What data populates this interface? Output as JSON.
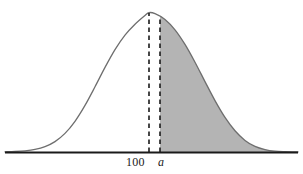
{
  "figure": {
    "title": "",
    "background_color": "#ffffff",
    "curve_color": "#6e6e6e",
    "shade_color": "#b4b4b4",
    "axis_color": "#1a1a1a",
    "dash_color": "#1a1a1a"
  },
  "labels": {
    "mean": "100",
    "cutoff": "a"
  },
  "chart_data": {
    "type": "area",
    "xlabel": "",
    "ylabel": "",
    "grid": false,
    "legend": null,
    "distribution": "normal",
    "mean": 100,
    "mean_pixel_x": 149,
    "cutoff_label": "a",
    "cutoff_pixel_x": 160,
    "baseline_pixel_y": 152,
    "peak_pixel_y": 12,
    "axis_x_start": 5,
    "axis_x_end": 298,
    "shaded_region": "x >= a (right tail)",
    "shaded_fill": "#b4b4b4",
    "markers": [
      {
        "label": "100",
        "pixel_x": 149,
        "style": "dashed-vertical",
        "from_y": 152,
        "to_y": 13
      },
      {
        "label": "a",
        "pixel_x": 160,
        "style": "dashed-vertical",
        "from_y": 152,
        "to_y": 17
      }
    ],
    "curve_points": [
      {
        "x": 5,
        "y": 151.8
      },
      {
        "x": 15,
        "y": 151.5
      },
      {
        "x": 25,
        "y": 150.8
      },
      {
        "x": 35,
        "y": 149.4
      },
      {
        "x": 45,
        "y": 146.6
      },
      {
        "x": 55,
        "y": 141.6
      },
      {
        "x": 65,
        "y": 133.4
      },
      {
        "x": 75,
        "y": 121.3
      },
      {
        "x": 85,
        "y": 105.4
      },
      {
        "x": 95,
        "y": 86.8
      },
      {
        "x": 105,
        "y": 67.4
      },
      {
        "x": 115,
        "y": 49.6
      },
      {
        "x": 125,
        "y": 35.1
      },
      {
        "x": 135,
        "y": 24.2
      },
      {
        "x": 145,
        "y": 15.4
      },
      {
        "x": 149,
        "y": 12.6
      },
      {
        "x": 155,
        "y": 13.6
      },
      {
        "x": 165,
        "y": 19.4
      },
      {
        "x": 175,
        "y": 29.8
      },
      {
        "x": 185,
        "y": 44.4
      },
      {
        "x": 195,
        "y": 62.2
      },
      {
        "x": 205,
        "y": 81.6
      },
      {
        "x": 215,
        "y": 100.6
      },
      {
        "x": 225,
        "y": 117.4
      },
      {
        "x": 235,
        "y": 130.8
      },
      {
        "x": 245,
        "y": 140.4
      },
      {
        "x": 255,
        "y": 146.4
      },
      {
        "x": 265,
        "y": 149.6
      },
      {
        "x": 275,
        "y": 151.2
      },
      {
        "x": 285,
        "y": 151.7
      },
      {
        "x": 298,
        "y": 151.9
      }
    ]
  }
}
